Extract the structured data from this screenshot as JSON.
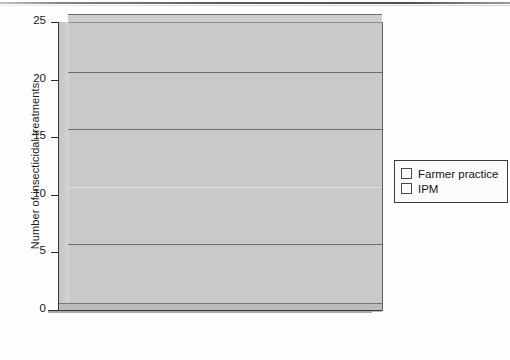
{
  "chart_data": {
    "type": "bar",
    "title": "",
    "subtitle": "",
    "xlabel": "",
    "ylabel": "Number of insecticidal treatments",
    "categories": [
      "cabbage",
      "shallots",
      "chillies",
      "yardlong beans",
      "soybean"
    ],
    "series": [
      {
        "name": "Farmer practice",
        "values": [
          18.5,
          22.2,
          12.7,
          7.6,
          1.7
        ],
        "color": "#9a9a9a"
      },
      {
        "name": "IPM",
        "values": [
          5.3,
          8.1,
          5.3,
          2.0,
          0.6
        ],
        "color": "#6e6e6e"
      }
    ],
    "ylim": [
      0,
      25
    ],
    "ytick_labels": [
      "0",
      "5",
      "10",
      "15",
      "20",
      "25"
    ],
    "ytick_values": [
      0,
      5,
      10,
      15,
      20,
      25
    ],
    "grid": true,
    "grid_axis": "y",
    "legend_position": "right",
    "style": "3d-column",
    "plot_background": "#c9c9c9",
    "page_background": "#fdfdfd"
  },
  "axis": {
    "y_label": "Number of insecticidal treatments",
    "ticks": [
      {
        "label": "25",
        "value": 25
      },
      {
        "label": "20",
        "value": 20
      },
      {
        "label": "15",
        "value": 15
      },
      {
        "label": "10",
        "value": 10
      },
      {
        "label": "5",
        "value": 5
      },
      {
        "label": "0",
        "value": 0
      }
    ]
  },
  "categories": [
    {
      "label": "cabbage",
      "line2": ""
    },
    {
      "label": "shallots",
      "line2": ""
    },
    {
      "label": "chillies",
      "line2": ""
    },
    {
      "label": "yardlong",
      "line2": "beans"
    },
    {
      "label": "soybean",
      "line2": ""
    }
  ],
  "legend": {
    "items": [
      {
        "label": "Farmer practice",
        "color": "#9a9a9a"
      },
      {
        "label": "IPM",
        "color": "#6e6e6e"
      }
    ]
  }
}
